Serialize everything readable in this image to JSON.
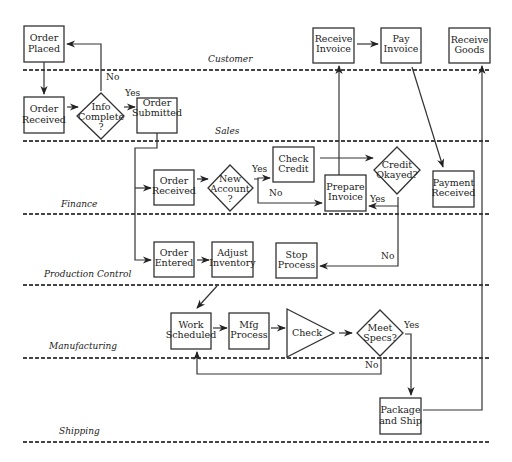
{
  "diagram": {
    "type": "swimlane-flowchart",
    "lanes": [
      {
        "id": "customer",
        "label": "Customer",
        "line_y": 70,
        "label_x": 232,
        "label_y": 62
      },
      {
        "id": "sales",
        "label": "Sales",
        "line_y": 142,
        "label_x": 226,
        "label_y": 134
      },
      {
        "id": "finance",
        "label": "Finance",
        "line_y": 214,
        "label_x": 72,
        "label_y": 206
      },
      {
        "id": "production",
        "label": "Production Control",
        "line_y": 285,
        "label_x": 90,
        "label_y": 277
      },
      {
        "id": "manufacturing",
        "label": "Manufacturing",
        "line_y": 357,
        "label_x": 78,
        "label_y": 349
      },
      {
        "id": "shipping",
        "label": "Shipping",
        "line_y": 440,
        "label_x": 75,
        "label_y": 433
      }
    ],
    "nodes": [
      {
        "id": "order-placed",
        "shape": "box",
        "lines": [
          "Order",
          "Placed"
        ],
        "x": 24,
        "y": 26,
        "w": 40,
        "h": 36,
        "lane": "Customer"
      },
      {
        "id": "receive-invoice",
        "shape": "box",
        "lines": [
          "Receive",
          "Invoice"
        ],
        "x": 313,
        "y": 27,
        "w": 41,
        "h": 36,
        "lane": "Customer"
      },
      {
        "id": "pay-invoice",
        "shape": "box",
        "lines": [
          "Pay",
          "Invoice"
        ],
        "x": 381,
        "y": 27,
        "w": 40,
        "h": 36,
        "lane": "Customer"
      },
      {
        "id": "receive-goods",
        "shape": "box",
        "lines": [
          "Receive",
          "Goods"
        ],
        "x": 449,
        "y": 27,
        "w": 41,
        "h": 36,
        "lane": "Customer"
      },
      {
        "id": "order-received-sales",
        "shape": "box",
        "lines": [
          "Order",
          "Received"
        ],
        "x": 24,
        "y": 97,
        "w": 40,
        "h": 36,
        "lane": "Sales"
      },
      {
        "id": "info-complete",
        "shape": "diamond",
        "lines": [
          "Info",
          "Complete",
          "?"
        ],
        "cx": 100,
        "cy": 116,
        "rw": 24,
        "rh": 24,
        "lane": "Sales"
      },
      {
        "id": "order-submitted",
        "shape": "box",
        "lines": [
          "Order",
          "Submitted"
        ],
        "x": 137,
        "y": 97,
        "w": 40,
        "h": 36,
        "lane": "Sales"
      },
      {
        "id": "order-received-finance",
        "shape": "box",
        "lines": [
          "Order",
          "Received"
        ],
        "x": 154,
        "y": 169,
        "w": 40,
        "h": 36,
        "lane": "Finance"
      },
      {
        "id": "new-account",
        "shape": "diamond",
        "lines": [
          "New",
          "Account",
          "?"
        ],
        "cx": 230,
        "cy": 188,
        "rw": 23,
        "rh": 23,
        "lane": "Finance"
      },
      {
        "id": "check-credit",
        "shape": "box",
        "lines": [
          "Check",
          "Credit"
        ],
        "x": 273,
        "y": 147,
        "w": 41,
        "h": 36,
        "lane": "Finance"
      },
      {
        "id": "prepare-invoice",
        "shape": "box",
        "lines": [
          "Prepare",
          "Invoice"
        ],
        "x": 325,
        "y": 175,
        "w": 41,
        "h": 36,
        "lane": "Finance"
      },
      {
        "id": "credit-okayed",
        "shape": "diamond",
        "lines": [
          "Credit",
          "Okayed?"
        ],
        "cx": 397,
        "cy": 170,
        "rw": 23,
        "rh": 24,
        "lane": "Finance"
      },
      {
        "id": "payment-received",
        "shape": "box",
        "lines": [
          "Payment",
          "Received"
        ],
        "x": 433,
        "y": 171,
        "w": 41,
        "h": 36,
        "lane": "Finance"
      },
      {
        "id": "order-entered",
        "shape": "box",
        "lines": [
          "Order",
          "Entered"
        ],
        "x": 154,
        "y": 242,
        "w": 40,
        "h": 36,
        "lane": "Production Control"
      },
      {
        "id": "adjust-inventory",
        "shape": "box",
        "lines": [
          "Adjust",
          "Inventory"
        ],
        "x": 212,
        "y": 242,
        "w": 41,
        "h": 36,
        "lane": "Production Control"
      },
      {
        "id": "stop-process",
        "shape": "box",
        "lines": [
          "Stop",
          "Process"
        ],
        "x": 276,
        "y": 243,
        "w": 41,
        "h": 36,
        "lane": "Production Control"
      },
      {
        "id": "work-scheduled",
        "shape": "box",
        "lines": [
          "Work",
          "Scheduled"
        ],
        "x": 171,
        "y": 313,
        "w": 40,
        "h": 36,
        "lane": "Manufacturing"
      },
      {
        "id": "mfg-process",
        "shape": "box",
        "lines": [
          "Mfg",
          "Process"
        ],
        "x": 229,
        "y": 313,
        "w": 40,
        "h": 36,
        "lane": "Manufacturing"
      },
      {
        "id": "check",
        "shape": "triangle",
        "lines": [
          "Check"
        ],
        "x": 287,
        "y": 309,
        "w": 47,
        "h": 47,
        "lane": "Manufacturing"
      },
      {
        "id": "meet-specs",
        "shape": "diamond",
        "lines": [
          "Meet",
          "Specs?"
        ],
        "cx": 380,
        "cy": 333,
        "rw": 23,
        "rh": 23,
        "lane": "Manufacturing"
      },
      {
        "id": "package-and-ship",
        "shape": "box",
        "lines": [
          "Package",
          "and Ship"
        ],
        "x": 380,
        "y": 398,
        "w": 41,
        "h": 36,
        "lane": "Shipping"
      }
    ],
    "edges": [
      {
        "from": "order-placed",
        "to": "order-received-sales",
        "label": ""
      },
      {
        "from": "order-received-sales",
        "to": "info-complete",
        "label": ""
      },
      {
        "from": "info-complete",
        "to": "order-placed",
        "label": "No"
      },
      {
        "from": "info-complete",
        "to": "order-submitted",
        "label": "Yes"
      },
      {
        "from": "order-submitted",
        "to": "order-received-finance",
        "label": ""
      },
      {
        "from": "order-submitted",
        "to": "order-entered",
        "label": ""
      },
      {
        "from": "order-received-finance",
        "to": "new-account",
        "label": ""
      },
      {
        "from": "new-account",
        "to": "check-credit",
        "label": "Yes"
      },
      {
        "from": "new-account",
        "to": "prepare-invoice",
        "label": "No"
      },
      {
        "from": "check-credit",
        "to": "credit-okayed",
        "label": ""
      },
      {
        "from": "credit-okayed",
        "to": "prepare-invoice",
        "label": "Yes"
      },
      {
        "from": "credit-okayed",
        "to": "stop-process",
        "label": "No"
      },
      {
        "from": "prepare-invoice",
        "to": "receive-invoice",
        "label": ""
      },
      {
        "from": "receive-invoice",
        "to": "pay-invoice",
        "label": ""
      },
      {
        "from": "pay-invoice",
        "to": "payment-received",
        "label": ""
      },
      {
        "from": "order-entered",
        "to": "adjust-inventory",
        "label": ""
      },
      {
        "from": "adjust-inventory",
        "to": "work-scheduled",
        "label": ""
      },
      {
        "from": "work-scheduled",
        "to": "mfg-process",
        "label": ""
      },
      {
        "from": "mfg-process",
        "to": "check",
        "label": ""
      },
      {
        "from": "check",
        "to": "meet-specs",
        "label": ""
      },
      {
        "from": "meet-specs",
        "to": "work-scheduled",
        "label": "No"
      },
      {
        "from": "meet-specs",
        "to": "package-and-ship",
        "label": "Yes"
      },
      {
        "from": "package-and-ship",
        "to": "receive-goods",
        "label": ""
      }
    ],
    "edge_labels": {
      "info_no": "No",
      "info_yes": "Yes",
      "account_yes": "Yes",
      "account_no": "No",
      "credit_yes": "Yes",
      "credit_no": "No",
      "specs_yes": "Yes",
      "specs_no": "No"
    }
  }
}
